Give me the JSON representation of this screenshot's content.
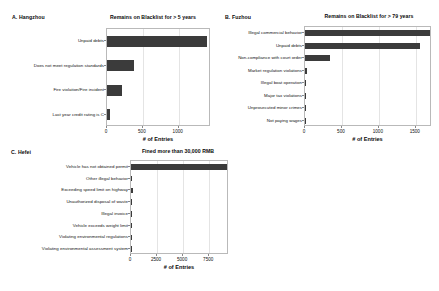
{
  "figure": {
    "background": "#ffffff",
    "bar_color": "#3b3b3b",
    "grid_color": "#e4e4e4",
    "axis_color": "#b9b9b9"
  },
  "panels": [
    {
      "tag": "A. Hangzhou",
      "title": "Remains on Blacklist for > 5 years",
      "xlabel": "# of Entries"
    },
    {
      "tag": "B. Fuzhou",
      "title": "Remains on Blacklist for > 79 years",
      "xlabel": "# of Entries"
    },
    {
      "tag": "C. Hefei",
      "title": "Fined more than 30,000 RMB",
      "xlabel": "# of Entries"
    }
  ],
  "chart_data": [
    {
      "type": "bar",
      "orientation": "horizontal",
      "panel": "A",
      "title": "Remains on Blacklist for > 5 years",
      "xlabel": "# of Entries",
      "ylabel": "",
      "xlim": [
        0,
        1450
      ],
      "xticks": [
        0,
        500,
        1000
      ],
      "xticklabels": [
        "0",
        "500",
        "1000"
      ],
      "grid": true,
      "legend": "none",
      "categories": [
        "Unpaid debts",
        "Does not meet regulation standards",
        "Fire violation/Fire incident",
        "Last year credit rating is C"
      ],
      "values": [
        1390,
        380,
        215,
        35
      ]
    },
    {
      "type": "bar",
      "orientation": "horizontal",
      "panel": "B",
      "title": "Remains on Blacklist for > 79 years",
      "xlabel": "# of Entries",
      "ylabel": "",
      "xlim": [
        0,
        1720
      ],
      "xticks": [
        0,
        500,
        1000,
        1500
      ],
      "xticklabels": [
        "0",
        "500",
        "1000",
        "1500"
      ],
      "grid": true,
      "legend": "none",
      "categories": [
        "Illegal commercial behavior",
        "Unpaid debts",
        "Non-compliance with court order",
        "Market regulation violations",
        "Illegal boat operation",
        "Major tax violations",
        "Unprosecuted minor crimes",
        "Not paying wages"
      ],
      "values": [
        1700,
        1560,
        345,
        22,
        10,
        8,
        6,
        5
      ]
    },
    {
      "type": "bar",
      "orientation": "horizontal",
      "panel": "C",
      "title": "Fined more than 30,000 RMB",
      "xlabel": "# of Entries",
      "ylabel": "",
      "xlim": [
        0,
        9400
      ],
      "xticks": [
        0,
        2500,
        5000,
        7500
      ],
      "xticklabels": [
        "0",
        "2500",
        "5000",
        "7500"
      ],
      "grid": true,
      "legend": "none",
      "categories": [
        "Vehicle has not obtained permit",
        "Other illegal behavior",
        "Exceeding speed limit on highway",
        "Unauthorized disposal of waste",
        "Illegal invoice",
        "Vehicle exceeds weight limit",
        "Violating environmental regulations",
        "Violating environmental assessment system"
      ],
      "values": [
        9300,
        60,
        230,
        40,
        30,
        25,
        20,
        15
      ]
    }
  ]
}
